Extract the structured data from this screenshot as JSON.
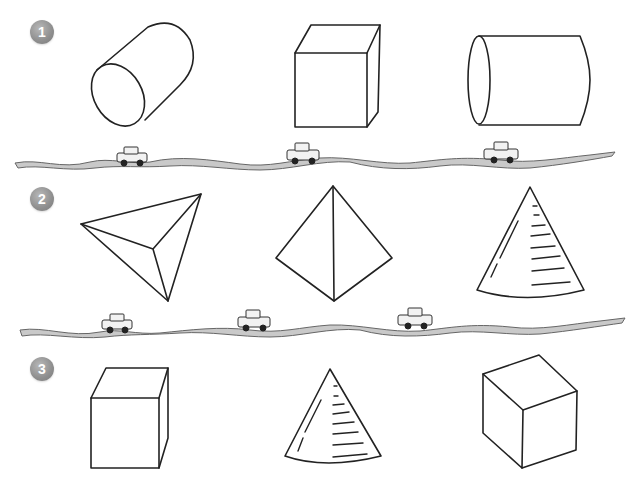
{
  "worksheet": {
    "rows": [
      {
        "number": "1",
        "shapes": [
          {
            "name": "cylinder-tilted"
          },
          {
            "name": "cuboid"
          },
          {
            "name": "cylinder-horizontal"
          }
        ]
      },
      {
        "number": "2",
        "shapes": [
          {
            "name": "triangular-pyramid-top-view"
          },
          {
            "name": "triangular-pyramid-side-view"
          },
          {
            "name": "cone"
          }
        ]
      },
      {
        "number": "3",
        "shapes": [
          {
            "name": "cuboid"
          },
          {
            "name": "cone"
          },
          {
            "name": "cube-isometric"
          }
        ]
      }
    ],
    "dividers": [
      {
        "name": "road-divider-1",
        "cars": 3
      },
      {
        "name": "road-divider-2",
        "cars": 3
      }
    ],
    "colors": {
      "badge": "#8e8e8e",
      "road": "#c9c9c9",
      "stroke": "#222222"
    }
  }
}
